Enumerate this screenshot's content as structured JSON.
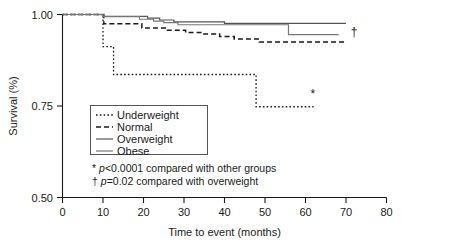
{
  "chart_data": {
    "type": "line",
    "title": "",
    "xlabel": "Time to event (months)",
    "ylabel": "Survival (%)",
    "xlim": [
      0,
      80
    ],
    "ylim": [
      0.5,
      1.0
    ],
    "xticks": [
      "0",
      "10",
      "20",
      "30",
      "40",
      "50",
      "60",
      "70",
      "80"
    ],
    "yticks": [
      "1.00",
      "0.75",
      "0.50"
    ],
    "grid": false,
    "legend_position": "inside-lower-left",
    "series": [
      {
        "name": "Underweight",
        "style": "dotted",
        "color": "#1a1a1a",
        "points": [
          [
            0,
            1.0
          ],
          [
            10,
            1.0
          ],
          [
            10,
            0.912
          ],
          [
            12.6,
            0.912
          ],
          [
            12.6,
            0.836
          ],
          [
            47.8,
            0.836
          ],
          [
            47.8,
            0.748
          ],
          [
            62.0,
            0.748
          ]
        ]
      },
      {
        "name": "Normal",
        "style": "dashed",
        "color": "#1a1a1a",
        "points": [
          [
            0,
            1.0
          ],
          [
            10.2,
            1.0
          ],
          [
            10.2,
            0.975
          ],
          [
            19.6,
            0.975
          ],
          [
            19.6,
            0.963
          ],
          [
            25.4,
            0.963
          ],
          [
            25.4,
            0.957
          ],
          [
            30.4,
            0.957
          ],
          [
            30.4,
            0.951
          ],
          [
            34.6,
            0.951
          ],
          [
            34.6,
            0.947
          ],
          [
            38.8,
            0.947
          ],
          [
            38.8,
            0.94
          ],
          [
            42.4,
            0.94
          ],
          [
            42.4,
            0.933
          ],
          [
            48.6,
            0.933
          ],
          [
            48.6,
            0.925
          ],
          [
            70.0,
            0.925
          ]
        ]
      },
      {
        "name": "Overweight",
        "style": "solid",
        "color": "#555555",
        "points": [
          [
            0,
            1.0
          ],
          [
            10.0,
            1.0
          ],
          [
            10.0,
            0.995
          ],
          [
            21.0,
            0.995
          ],
          [
            21.0,
            0.99
          ],
          [
            24.0,
            0.99
          ],
          [
            24.0,
            0.985
          ],
          [
            27.5,
            0.985
          ],
          [
            27.5,
            0.98
          ],
          [
            40.0,
            0.98
          ],
          [
            40.0,
            0.976
          ],
          [
            70.0,
            0.976
          ]
        ]
      },
      {
        "name": "Obese",
        "style": "solid",
        "color": "#777777",
        "points": [
          [
            0,
            1.0
          ],
          [
            10.0,
            1.0
          ],
          [
            10.0,
            0.994
          ],
          [
            19.0,
            0.994
          ],
          [
            19.0,
            0.987
          ],
          [
            22.5,
            0.987
          ],
          [
            22.5,
            0.982
          ],
          [
            25.0,
            0.982
          ],
          [
            25.0,
            0.978
          ],
          [
            28.5,
            0.978
          ],
          [
            28.5,
            0.972
          ],
          [
            55.8,
            0.972
          ],
          [
            55.8,
            0.945
          ],
          [
            68.2,
            0.945
          ]
        ]
      }
    ],
    "annotations": [
      {
        "symbol": "*",
        "x": 61.8,
        "y": 0.772,
        "name": "asterisk-marker"
      },
      {
        "symbol": "†",
        "x": 72.0,
        "y": 0.941,
        "name": "dagger-marker"
      }
    ],
    "footnotes": [
      {
        "symbol": "*",
        "stat": "p",
        "relation": "<0.0001",
        "text": " compared with other groups"
      },
      {
        "symbol": "†",
        "stat": "p",
        "relation": "=0.02",
        "text": " compared with overweight"
      }
    ]
  },
  "legend": {
    "items": [
      {
        "label": "Underweight"
      },
      {
        "label": "Normal"
      },
      {
        "label": "Overweight"
      },
      {
        "label": "Obese"
      }
    ]
  }
}
